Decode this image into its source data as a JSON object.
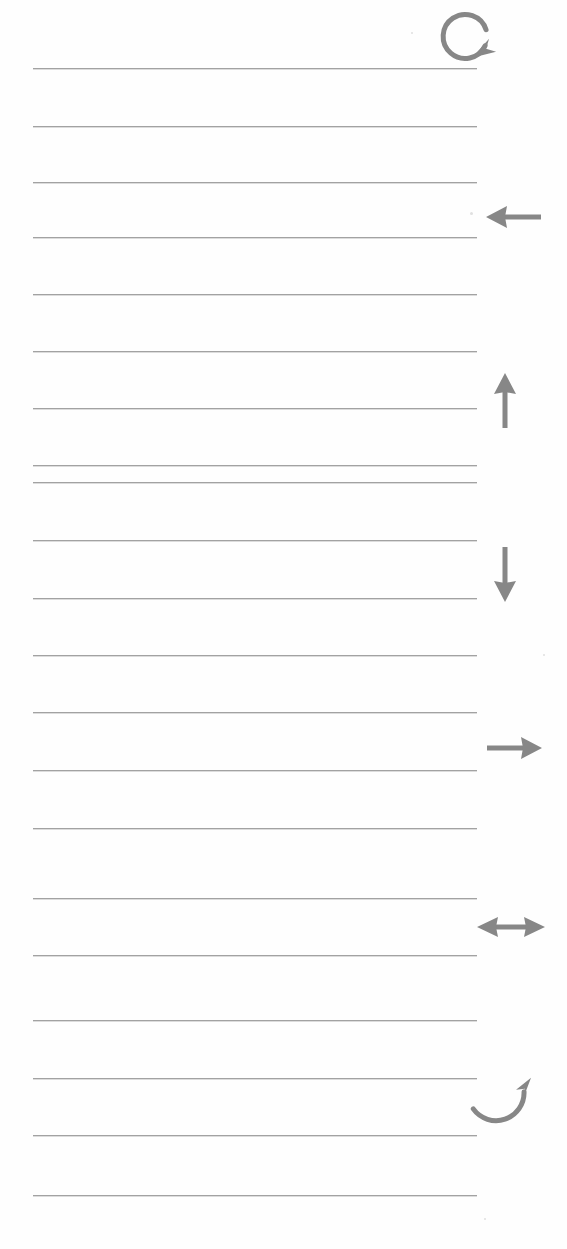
{
  "page": {
    "width": 567,
    "height": 1249,
    "background_color": "#ffffff",
    "paper_color": "#fefefe"
  },
  "rules": {
    "label": "Ruled Lines",
    "color": "#9b9b9b",
    "thickness_px": 1,
    "left_x": 33,
    "right_x": 477,
    "count": 21,
    "spacing_px": 57,
    "y_positions": [
      68,
      126,
      182,
      237,
      294,
      351,
      408,
      465,
      482,
      540,
      598,
      655,
      712,
      770,
      828,
      898,
      955,
      1020,
      1078,
      1135,
      1195
    ]
  },
  "annotations": {
    "label": "Margin Arrow Annotations",
    "color": "#878787",
    "count": 7,
    "items": [
      {
        "icon": "rotate-counterclockwise-icon",
        "name": "Rotate Counterclockwise",
        "direction": "counterclockwise",
        "x": 472,
        "y": 8,
        "width": 62,
        "height": 58
      },
      {
        "icon": "arrow-left-icon",
        "name": "Arrow Left",
        "direction": "left",
        "x": 485,
        "y": 202,
        "width": 58,
        "height": 30
      },
      {
        "icon": "arrow-up-icon",
        "name": "Arrow Up",
        "direction": "up",
        "x": 489,
        "y": 372,
        "width": 32,
        "height": 58
      },
      {
        "icon": "arrow-down-icon",
        "name": "Arrow Down",
        "direction": "down",
        "x": 489,
        "y": 545,
        "width": 32,
        "height": 58
      },
      {
        "icon": "arrow-right-icon",
        "name": "Arrow Right",
        "direction": "right",
        "x": 485,
        "y": 733,
        "width": 58,
        "height": 30
      },
      {
        "icon": "arrow-left-right-icon",
        "name": "Arrow Left Right",
        "direction": "horizontal",
        "x": 476,
        "y": 912,
        "width": 70,
        "height": 30
      },
      {
        "icon": "rotate-clockwise-icon",
        "name": "Rotate Clockwise",
        "direction": "clockwise",
        "x": 470,
        "y": 1085,
        "width": 66,
        "height": 52
      }
    ]
  },
  "specks": [
    {
      "x": 470,
      "y": 212,
      "size": 3
    },
    {
      "x": 411,
      "y": 32,
      "size": 2
    },
    {
      "x": 543,
      "y": 654,
      "size": 2
    },
    {
      "x": 484,
      "y": 1218,
      "size": 2
    }
  ]
}
